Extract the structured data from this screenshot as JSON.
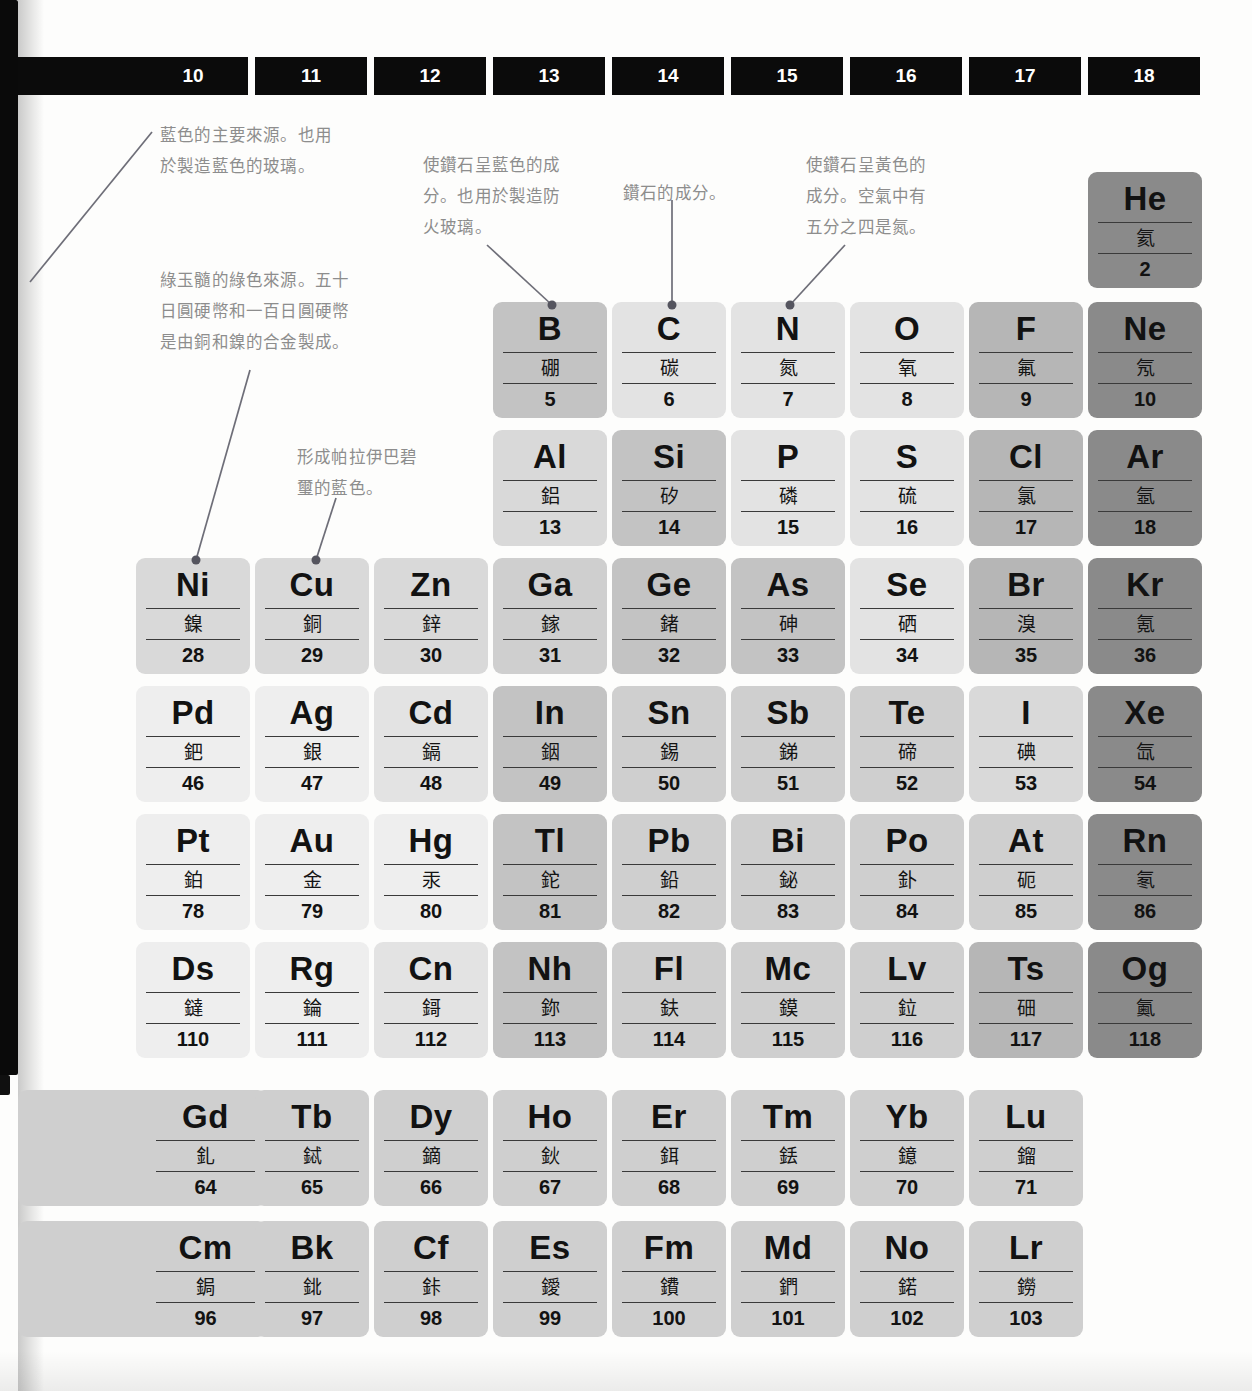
{
  "page": {
    "top_fragment": "",
    "language": "zh-Hant"
  },
  "group_headers": [
    {
      "label": "10",
      "x": 18,
      "width": 230,
      "label_offset": 60
    },
    {
      "label": "11",
      "x": 255,
      "width": 112,
      "label_offset": 0
    },
    {
      "label": "12",
      "x": 374,
      "width": 112,
      "label_offset": 0
    },
    {
      "label": "13",
      "x": 493,
      "width": 112,
      "label_offset": 0
    },
    {
      "label": "14",
      "x": 612,
      "width": 112,
      "label_offset": 0
    },
    {
      "label": "15",
      "x": 731,
      "width": 112,
      "label_offset": 0
    },
    {
      "label": "16",
      "x": 850,
      "width": 112,
      "label_offset": 0
    },
    {
      "label": "17",
      "x": 969,
      "width": 112,
      "label_offset": 0
    },
    {
      "label": "18",
      "x": 1088,
      "width": 112,
      "label_offset": 0
    }
  ],
  "colors": {
    "lightest": "#eeeeee",
    "light": "#e3e3e3",
    "mid_light": "#d9d9d9",
    "mid": "#cfcfcf",
    "mid_dark": "#c3c3c3",
    "dark": "#b6b6b6",
    "darker": "#a3a3a3",
    "noble": "#8a8a8a",
    "text": "#121212",
    "header_bar": "#0b0b0b",
    "note_text": "#8d8d8d",
    "leader": "#6e6e78"
  },
  "elements": [
    {
      "symbol": "He",
      "name": "氦",
      "number": "2",
      "x": 1088,
      "y": 172,
      "shade": "noble"
    },
    {
      "symbol": "B",
      "name": "硼",
      "number": "5",
      "x": 493,
      "y": 302,
      "shade": "mid_dark"
    },
    {
      "symbol": "C",
      "name": "碳",
      "number": "6",
      "x": 612,
      "y": 302,
      "shade": "light"
    },
    {
      "symbol": "N",
      "name": "氮",
      "number": "7",
      "x": 731,
      "y": 302,
      "shade": "light"
    },
    {
      "symbol": "O",
      "name": "氧",
      "number": "8",
      "x": 850,
      "y": 302,
      "shade": "light"
    },
    {
      "symbol": "F",
      "name": "氟",
      "number": "9",
      "x": 969,
      "y": 302,
      "shade": "dark"
    },
    {
      "symbol": "Ne",
      "name": "氖",
      "number": "10",
      "x": 1088,
      "y": 302,
      "shade": "noble"
    },
    {
      "symbol": "Al",
      "name": "鋁",
      "number": "13",
      "x": 493,
      "y": 430,
      "shade": "mid_light"
    },
    {
      "symbol": "Si",
      "name": "矽",
      "number": "14",
      "x": 612,
      "y": 430,
      "shade": "mid_dark"
    },
    {
      "symbol": "P",
      "name": "磷",
      "number": "15",
      "x": 731,
      "y": 430,
      "shade": "light"
    },
    {
      "symbol": "S",
      "name": "硫",
      "number": "16",
      "x": 850,
      "y": 430,
      "shade": "light"
    },
    {
      "symbol": "Cl",
      "name": "氯",
      "number": "17",
      "x": 969,
      "y": 430,
      "shade": "dark"
    },
    {
      "symbol": "Ar",
      "name": "氬",
      "number": "18",
      "x": 1088,
      "y": 430,
      "shade": "noble"
    },
    {
      "symbol": "Ni",
      "name": "鎳",
      "number": "28",
      "x": 136,
      "y": 558,
      "shade": "mid_light"
    },
    {
      "symbol": "Cu",
      "name": "銅",
      "number": "29",
      "x": 255,
      "y": 558,
      "shade": "mid_light"
    },
    {
      "symbol": "Zn",
      "name": "鋅",
      "number": "30",
      "x": 374,
      "y": 558,
      "shade": "mid_light"
    },
    {
      "symbol": "Ga",
      "name": "鎵",
      "number": "31",
      "x": 493,
      "y": 558,
      "shade": "mid"
    },
    {
      "symbol": "Ge",
      "name": "鍺",
      "number": "32",
      "x": 612,
      "y": 558,
      "shade": "mid_dark"
    },
    {
      "symbol": "As",
      "name": "砷",
      "number": "33",
      "x": 731,
      "y": 558,
      "shade": "mid_dark"
    },
    {
      "symbol": "Se",
      "name": "硒",
      "number": "34",
      "x": 850,
      "y": 558,
      "shade": "light"
    },
    {
      "symbol": "Br",
      "name": "溴",
      "number": "35",
      "x": 969,
      "y": 558,
      "shade": "dark"
    },
    {
      "symbol": "Kr",
      "name": "氪",
      "number": "36",
      "x": 1088,
      "y": 558,
      "shade": "noble"
    },
    {
      "symbol": "Pd",
      "name": "鈀",
      "number": "46",
      "x": 136,
      "y": 686,
      "shade": "lightest"
    },
    {
      "symbol": "Ag",
      "name": "銀",
      "number": "47",
      "x": 255,
      "y": 686,
      "shade": "lightest"
    },
    {
      "symbol": "Cd",
      "name": "鎘",
      "number": "48",
      "x": 374,
      "y": 686,
      "shade": "light"
    },
    {
      "symbol": "In",
      "name": "銦",
      "number": "49",
      "x": 493,
      "y": 686,
      "shade": "mid_dark"
    },
    {
      "symbol": "Sn",
      "name": "錫",
      "number": "50",
      "x": 612,
      "y": 686,
      "shade": "mid"
    },
    {
      "symbol": "Sb",
      "name": "銻",
      "number": "51",
      "x": 731,
      "y": 686,
      "shade": "mid"
    },
    {
      "symbol": "Te",
      "name": "碲",
      "number": "52",
      "x": 850,
      "y": 686,
      "shade": "mid"
    },
    {
      "symbol": "I",
      "name": "碘",
      "number": "53",
      "x": 969,
      "y": 686,
      "shade": "mid_light"
    },
    {
      "symbol": "Xe",
      "name": "氙",
      "number": "54",
      "x": 1088,
      "y": 686,
      "shade": "noble"
    },
    {
      "symbol": "Pt",
      "name": "鉑",
      "number": "78",
      "x": 136,
      "y": 814,
      "shade": "lightest"
    },
    {
      "symbol": "Au",
      "name": "金",
      "number": "79",
      "x": 255,
      "y": 814,
      "shade": "lightest"
    },
    {
      "symbol": "Hg",
      "name": "汞",
      "number": "80",
      "x": 374,
      "y": 814,
      "shade": "lightest"
    },
    {
      "symbol": "Tl",
      "name": "鉈",
      "number": "81",
      "x": 493,
      "y": 814,
      "shade": "mid_dark"
    },
    {
      "symbol": "Pb",
      "name": "鉛",
      "number": "82",
      "x": 612,
      "y": 814,
      "shade": "mid"
    },
    {
      "symbol": "Bi",
      "name": "鉍",
      "number": "83",
      "x": 731,
      "y": 814,
      "shade": "mid"
    },
    {
      "symbol": "Po",
      "name": "釙",
      "number": "84",
      "x": 850,
      "y": 814,
      "shade": "mid"
    },
    {
      "symbol": "At",
      "name": "砈",
      "number": "85",
      "x": 969,
      "y": 814,
      "shade": "mid"
    },
    {
      "symbol": "Rn",
      "name": "氡",
      "number": "86",
      "x": 1088,
      "y": 814,
      "shade": "noble"
    },
    {
      "symbol": "Ds",
      "name": "鐽",
      "number": "110",
      "x": 136,
      "y": 942,
      "shade": "lightest"
    },
    {
      "symbol": "Rg",
      "name": "錀",
      "number": "111",
      "x": 255,
      "y": 942,
      "shade": "lightest"
    },
    {
      "symbol": "Cn",
      "name": "鎶",
      "number": "112",
      "x": 374,
      "y": 942,
      "shade": "light"
    },
    {
      "symbol": "Nh",
      "name": "鉨",
      "number": "113",
      "x": 493,
      "y": 942,
      "shade": "mid_dark"
    },
    {
      "symbol": "Fl",
      "name": "鈇",
      "number": "114",
      "x": 612,
      "y": 942,
      "shade": "mid"
    },
    {
      "symbol": "Mc",
      "name": "鏌",
      "number": "115",
      "x": 731,
      "y": 942,
      "shade": "mid"
    },
    {
      "symbol": "Lv",
      "name": "鉝",
      "number": "116",
      "x": 850,
      "y": 942,
      "shade": "mid"
    },
    {
      "symbol": "Ts",
      "name": "鿬",
      "number": "117",
      "x": 969,
      "y": 942,
      "shade": "dark"
    },
    {
      "symbol": "Og",
      "name": "鿫",
      "number": "118",
      "x": 1088,
      "y": 942,
      "shade": "noble"
    }
  ],
  "lanthanides": [
    {
      "symbol": "Gd",
      "name": "釓",
      "number": "64",
      "x": 18,
      "y": 1090,
      "shade": "mid",
      "wide": true
    },
    {
      "symbol": "Tb",
      "name": "鋱",
      "number": "65",
      "x": 255,
      "y": 1090,
      "shade": "mid"
    },
    {
      "symbol": "Dy",
      "name": "鏑",
      "number": "66",
      "x": 374,
      "y": 1090,
      "shade": "mid"
    },
    {
      "symbol": "Ho",
      "name": "鈥",
      "number": "67",
      "x": 493,
      "y": 1090,
      "shade": "mid"
    },
    {
      "symbol": "Er",
      "name": "鉺",
      "number": "68",
      "x": 612,
      "y": 1090,
      "shade": "mid"
    },
    {
      "symbol": "Tm",
      "name": "銩",
      "number": "69",
      "x": 731,
      "y": 1090,
      "shade": "mid"
    },
    {
      "symbol": "Yb",
      "name": "鐿",
      "number": "70",
      "x": 850,
      "y": 1090,
      "shade": "mid"
    },
    {
      "symbol": "Lu",
      "name": "鎦",
      "number": "71",
      "x": 969,
      "y": 1090,
      "shade": "mid"
    }
  ],
  "actinides": [
    {
      "symbol": "Cm",
      "name": "鋦",
      "number": "96",
      "x": 18,
      "y": 1221,
      "shade": "mid",
      "wide": true
    },
    {
      "symbol": "Bk",
      "name": "鉳",
      "number": "97",
      "x": 255,
      "y": 1221,
      "shade": "mid"
    },
    {
      "symbol": "Cf",
      "name": "鉲",
      "number": "98",
      "x": 374,
      "y": 1221,
      "shade": "mid"
    },
    {
      "symbol": "Es",
      "name": "鑀",
      "number": "99",
      "x": 493,
      "y": 1221,
      "shade": "mid"
    },
    {
      "symbol": "Fm",
      "name": "鐨",
      "number": "100",
      "x": 612,
      "y": 1221,
      "shade": "mid"
    },
    {
      "symbol": "Md",
      "name": "鍆",
      "number": "101",
      "x": 731,
      "y": 1221,
      "shade": "mid"
    },
    {
      "symbol": "No",
      "name": "鍩",
      "number": "102",
      "x": 850,
      "y": 1221,
      "shade": "mid"
    },
    {
      "symbol": "Lr",
      "name": "鐒",
      "number": "103",
      "x": 969,
      "y": 1221,
      "shade": "mid"
    }
  ],
  "annotations": [
    {
      "id": "note-nickel",
      "text": "藍色的主要來源。也用\n於製造藍色的玻璃。",
      "x": 160,
      "y": 120,
      "width": 240,
      "leader": {
        "x1": 152,
        "y1": 132,
        "x2": 30,
        "y2": 282,
        "dot": null
      }
    },
    {
      "id": "note-copper",
      "text": "綠玉髓的綠色來源。五十\n日圓硬幣和一百日圓硬幣\n是由銅和鎳的合金製成。",
      "x": 160,
      "y": 265,
      "width": 260,
      "leader": {
        "x1": 250,
        "y1": 370,
        "x2": 196,
        "y2": 560,
        "dot": [
          196,
          560
        ]
      }
    },
    {
      "id": "note-tourmaline",
      "text": "形成帕拉伊巴碧\n璽的藍色。",
      "x": 297,
      "y": 442,
      "width": 180,
      "leader": {
        "x1": 336,
        "y1": 498,
        "x2": 316,
        "y2": 560,
        "dot": [
          316,
          560
        ]
      }
    },
    {
      "id": "note-boron",
      "text": "使鑽石呈藍色的成\n分。也用於製造防\n火玻璃。",
      "x": 423,
      "y": 150,
      "width": 200,
      "leader": {
        "x1": 487,
        "y1": 245,
        "x2": 552,
        "y2": 305,
        "dot": [
          552,
          305
        ]
      }
    },
    {
      "id": "note-carbon",
      "text": "鑽石的成分。",
      "x": 623,
      "y": 178,
      "width": 160,
      "leader": {
        "x1": 672,
        "y1": 200,
        "x2": 672,
        "y2": 305,
        "dot": [
          672,
          305
        ]
      }
    },
    {
      "id": "note-nitrogen",
      "text": "使鑽石呈黃色的\n成分。空氣中有\n五分之四是氮。",
      "x": 806,
      "y": 150,
      "width": 180,
      "leader": {
        "x1": 845,
        "y1": 245,
        "x2": 790,
        "y2": 305,
        "dot": [
          790,
          305
        ]
      }
    }
  ]
}
